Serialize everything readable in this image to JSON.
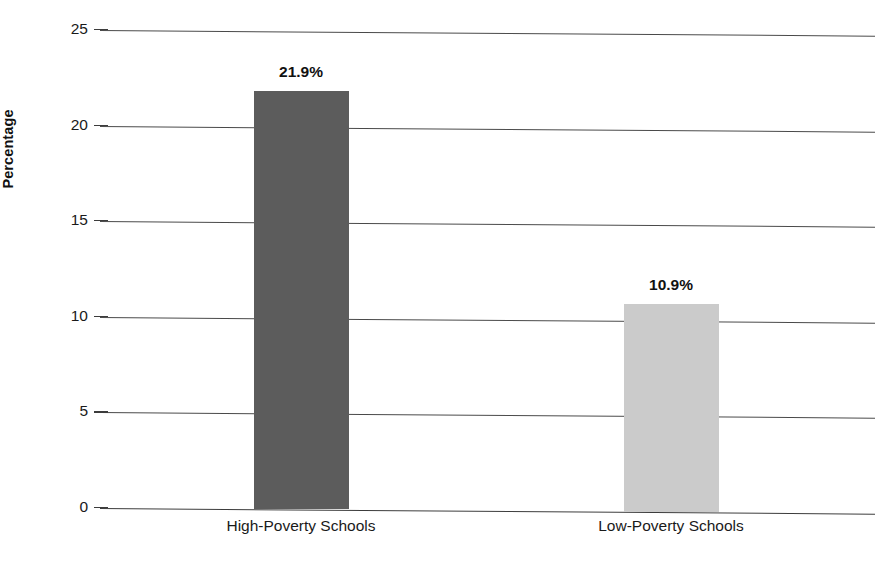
{
  "chart_data": {
    "type": "bar",
    "title": "",
    "title_cut_off": true,
    "categories": [
      "High-Poverty Schools",
      "Low-Poverty Schools"
    ],
    "values": [
      21.9,
      10.9
    ],
    "data_labels": [
      "21.9%",
      "10.9%"
    ],
    "bar_colors": [
      "#5c5c5c",
      "#cbcbcb"
    ],
    "xlabel": "",
    "ylabel": "Percentage",
    "ylim": [
      0,
      25
    ],
    "yticks": [
      0,
      5,
      10,
      15,
      20,
      25
    ],
    "ytick_labels": [
      "0",
      "5",
      "10",
      "15",
      "20",
      "25"
    ],
    "grid": true,
    "grid_axis": "y",
    "legend": false,
    "legend_position": "none"
  },
  "axis": {
    "y_title": "Percentage"
  }
}
